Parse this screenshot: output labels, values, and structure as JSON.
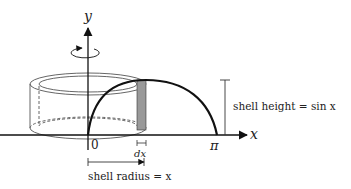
{
  "diagram": {
    "axes": {
      "y_label": "y",
      "x_label": "x",
      "origin_label": "0",
      "pi_label": "π"
    },
    "annotations": {
      "dx_label": "dx",
      "shell_height_label": "shell height = sin x",
      "shell_radius_label": "shell radius = x"
    },
    "colors": {
      "line": "#111111",
      "shell_fill": "#999999",
      "cylinder_line": "#555555"
    }
  }
}
